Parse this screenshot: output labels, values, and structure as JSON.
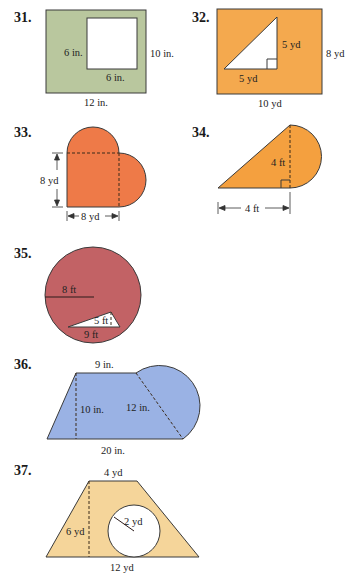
{
  "problems": [
    {
      "number": "31.",
      "shape": "rectangle with square cut out",
      "fill_color": "#b9c79e",
      "labels": {
        "square_side_left": "6 in.",
        "square_side_bottom": "6 in.",
        "height": "10 in.",
        "width": "12 in."
      }
    },
    {
      "number": "32.",
      "shape": "rectangle with right triangle cut out",
      "fill_color": "#f4a94e",
      "labels": {
        "triangle_leg_vertical": "5 yd",
        "triangle_leg_horizontal": "5 yd",
        "height": "8 yd",
        "width": "10 yd"
      }
    },
    {
      "number": "33.",
      "shape": "square with two semicircles (heart)",
      "fill_color": "#ee7a48",
      "labels": {
        "height": "8 yd",
        "width": "8 yd"
      }
    },
    {
      "number": "34.",
      "shape": "right triangle with semicircle",
      "fill_color": "#f4a03f",
      "labels": {
        "height": "4 ft",
        "base": "4 ft"
      }
    },
    {
      "number": "35.",
      "shape": "circle with triangle cut out",
      "fill_color": "#c26265",
      "labels": {
        "radius": "8 ft",
        "triangle_height": "5 ft",
        "triangle_base": "9 ft"
      }
    },
    {
      "number": "36.",
      "shape": "trapezoid with semicircle",
      "fill_color": "#9ab2e4",
      "labels": {
        "top": "9 in.",
        "height": "10 in.",
        "slant_diameter": "12 in.",
        "bottom": "20 in."
      }
    },
    {
      "number": "37.",
      "shape": "trapezoid with circle cut out",
      "fill_color": "#f5d59a",
      "labels": {
        "top": "4 yd",
        "radius": "2 yd",
        "height": "6 yd",
        "bottom": "12 yd"
      }
    }
  ]
}
